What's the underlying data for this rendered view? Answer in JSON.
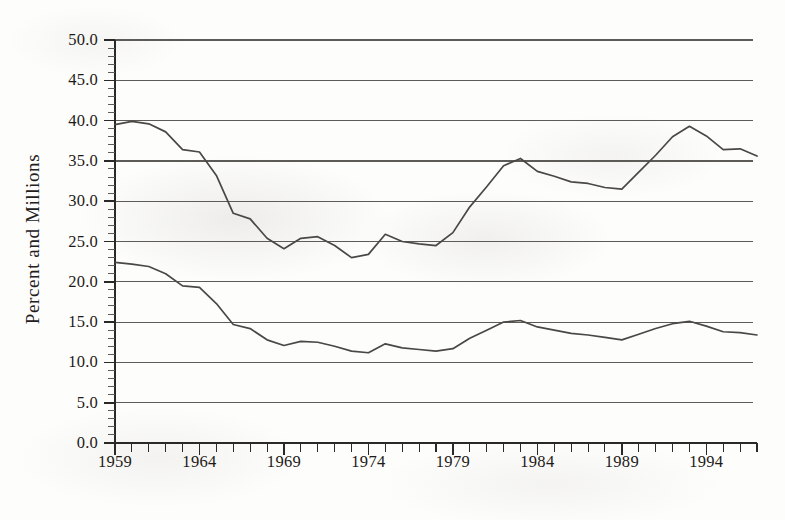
{
  "figure": {
    "axis_label_y": "Percent and Millions"
  },
  "chart_data": {
    "type": "line",
    "title": "",
    "subtitle": "",
    "xlabel": "",
    "ylabel": "Percent and Millions",
    "xlim": [
      1959,
      1997
    ],
    "ylim": [
      0.0,
      50.0
    ],
    "grid": true,
    "legend": "none",
    "y_ticks": [
      "0.0",
      "5.0",
      "10.0",
      "15.0",
      "20.0",
      "25.0",
      "30.0",
      "35.0",
      "40.0",
      "45.0",
      "50.0"
    ],
    "y_tick_values": [
      0.0,
      5.0,
      10.0,
      15.0,
      20.0,
      25.0,
      30.0,
      35.0,
      40.0,
      45.0,
      50.0
    ],
    "y_minor_tick_step": 1.0,
    "x_ticks": [
      "1959",
      "1964",
      "1969",
      "1974",
      "1979",
      "1984",
      "1989",
      "1994"
    ],
    "x_tick_values": [
      1959,
      1964,
      1969,
      1974,
      1979,
      1984,
      1989,
      1994
    ],
    "x_minor_tick_step": 1,
    "x": [
      1959,
      1960,
      1961,
      1962,
      1963,
      1964,
      1965,
      1966,
      1967,
      1968,
      1969,
      1970,
      1971,
      1972,
      1973,
      1974,
      1975,
      1976,
      1977,
      1978,
      1979,
      1980,
      1981,
      1982,
      1983,
      1984,
      1985,
      1986,
      1987,
      1988,
      1989,
      1990,
      1991,
      1992,
      1993,
      1994,
      1995,
      1996,
      1997
    ],
    "series": [
      {
        "name": "upper-series",
        "color": "#4a4844",
        "values": [
          39.5,
          39.9,
          39.6,
          38.6,
          36.4,
          36.1,
          33.2,
          28.5,
          27.8,
          25.4,
          24.1,
          25.4,
          25.6,
          24.5,
          23.0,
          23.4,
          25.9,
          25.0,
          24.7,
          24.5,
          26.1,
          29.3,
          31.8,
          34.4,
          35.3,
          33.7,
          33.1,
          32.4,
          32.2,
          31.7,
          31.5,
          33.6,
          35.7,
          38.0,
          39.3,
          38.1,
          36.4,
          36.5,
          35.6
        ]
      },
      {
        "name": "lower-series",
        "color": "#4a4844",
        "values": [
          22.4,
          22.2,
          21.9,
          21.0,
          19.5,
          19.3,
          17.3,
          14.7,
          14.2,
          12.8,
          12.1,
          12.6,
          12.5,
          12.0,
          11.4,
          11.2,
          12.3,
          11.8,
          11.6,
          11.4,
          11.7,
          13.0,
          14.0,
          15.0,
          15.2,
          14.4,
          14.0,
          13.6,
          13.4,
          13.1,
          12.8,
          13.5,
          14.2,
          14.8,
          15.1,
          14.5,
          13.8,
          13.7,
          13.4
        ]
      }
    ]
  }
}
